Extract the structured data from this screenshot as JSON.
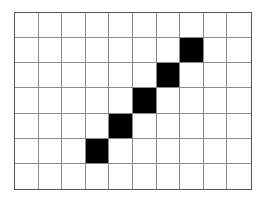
{
  "grid": {
    "columns": 10,
    "rows": 7,
    "fill_color": "#000000",
    "empty_color": "#ffffff",
    "line_color": "#8a8a8a",
    "filled_cells": [
      {
        "col": 7,
        "row": 1
      },
      {
        "col": 6,
        "row": 2
      },
      {
        "col": 5,
        "row": 3
      },
      {
        "col": 4,
        "row": 4
      },
      {
        "col": 3,
        "row": 5
      }
    ]
  }
}
